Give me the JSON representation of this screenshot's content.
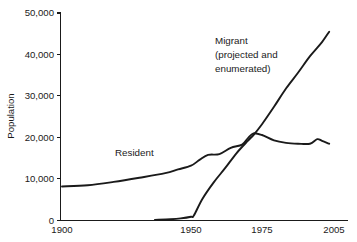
{
  "chart_data": {
    "type": "line",
    "title": "",
    "xlabel": "",
    "ylabel": "Population",
    "xlim": [
      1900,
      2005
    ],
    "ylim": [
      0,
      50000
    ],
    "grid": false,
    "legend_position": "inline-annotations",
    "x_ticks": [
      "1900",
      "1950",
      "1975",
      "2005"
    ],
    "x_tick_values": [
      1900,
      1950,
      1975,
      2005
    ],
    "y_ticks": [
      "0",
      "10,000",
      "20,000",
      "30,000",
      "40,000",
      "50,000"
    ],
    "y_tick_values": [
      0,
      10000,
      20000,
      30000,
      40000,
      50000
    ],
    "axis_note": "x-axis spacing is non-linear: 1900-1950 is compressed relative to 1950-1975 and 1975-2005",
    "series": [
      {
        "name": "Resident",
        "label_lines": [
          "Resident"
        ],
        "x": [
          1900,
          1910,
          1920,
          1930,
          1940,
          1945,
          1950,
          1953,
          1956,
          1960,
          1964,
          1968,
          1970,
          1972,
          1975,
          1980,
          1985,
          1990,
          1995,
          1998,
          2000,
          2003
        ],
        "values": [
          8200,
          8500,
          9300,
          10300,
          11400,
          12300,
          13200,
          14600,
          15800,
          16000,
          17500,
          18300,
          19800,
          21000,
          20600,
          19300,
          18700,
          18500,
          18500,
          19600,
          19200,
          18500
        ]
      },
      {
        "name": "Migrant (projected and enumerated)",
        "label_lines": [
          "Migrant",
          "(projected and",
          "enumerated)"
        ],
        "x": [
          1936,
          1942,
          1946,
          1950,
          1951,
          1954,
          1958,
          1962,
          1966,
          1970,
          1972,
          1975,
          1980,
          1985,
          1990,
          1995,
          2000,
          2003
        ],
        "values": [
          150,
          300,
          500,
          900,
          1200,
          5200,
          9200,
          12600,
          16200,
          19200,
          20600,
          23200,
          27400,
          31800,
          35600,
          39600,
          43000,
          45500
        ]
      }
    ],
    "annotations": [
      {
        "text": "Resident",
        "near_series": "Resident"
      },
      {
        "text": "Migrant (projected and enumerated)",
        "near_series": "Migrant"
      }
    ]
  },
  "labels": {
    "y_axis_title": "Population",
    "resident": "Resident",
    "migrant_line1": "Migrant",
    "migrant_line2": "(projected and",
    "migrant_line3": "enumerated)",
    "y0": "0",
    "y10k": "10,000",
    "y20k": "20,000",
    "y30k": "30,000",
    "y40k": "40,000",
    "y50k": "50,000",
    "x1900": "1900",
    "x1950": "1950",
    "x1975": "1975",
    "x2005": "2005"
  },
  "colors": {
    "line": "#1a1a1a",
    "axis": "#1a1a1a",
    "background": "#ffffff"
  }
}
